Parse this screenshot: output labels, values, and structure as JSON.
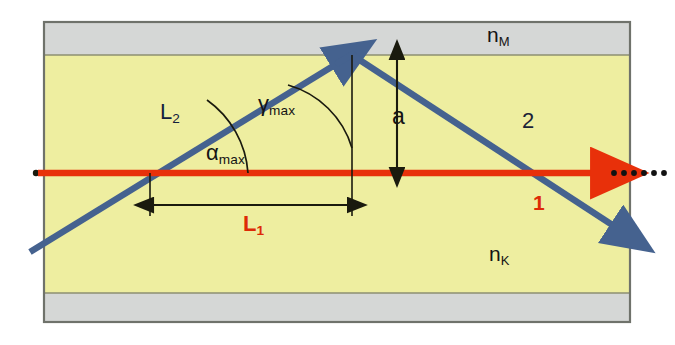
{
  "labels": {
    "cladding_index": "n",
    "cladding_index_sub": "M",
    "core_index": "n",
    "core_index_sub": "K",
    "path_l2": "L",
    "path_l2_sub": "2",
    "path_l1": "L",
    "path_l1_sub": "1",
    "angle_alpha": "α",
    "angle_alpha_sub": "max",
    "angle_gamma": "γ",
    "angle_gamma_sub": "max",
    "core_radius": "a",
    "ray_axial": "1",
    "ray_meridional": "2"
  },
  "colors": {
    "core_fill": "#eeeea0",
    "cladding_fill": "#d5d7d6",
    "frame_border": "#6f726b",
    "axial_ray": "#e8300a",
    "meridional_ray": "#45628f",
    "dimension_line": "#1a1a0e",
    "label_dark": "#141414",
    "label_red": "#dd2a06",
    "page_background": "#ffffff"
  },
  "geometry": {
    "frame": {
      "x": 44,
      "y": 22,
      "width": 586,
      "height": 300
    },
    "core": {
      "top_y": 55,
      "bottom_y": 293
    },
    "axis_y": 173,
    "reflection_point": {
      "x": 352,
      "y": 55
    },
    "entry_crossing": {
      "x": 150,
      "y": 173
    },
    "exit_crossing": {
      "x": 545,
      "y": 173
    },
    "l1_dimension": {
      "x1": 150,
      "x2": 352,
      "y": 205
    },
    "a_dimension": {
      "x": 397,
      "y1": 55,
      "y2": 173
    }
  }
}
